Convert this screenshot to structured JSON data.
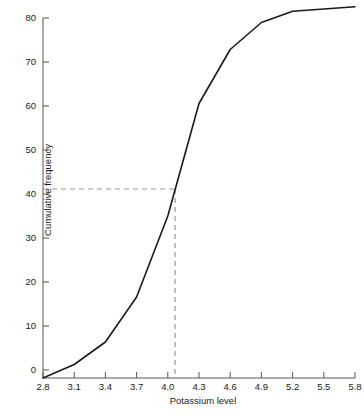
{
  "chart_data": {
    "type": "line",
    "title": "",
    "xlabel": "Potassium level",
    "ylabel": "Cumulative frequency",
    "xlim": [
      2.8,
      5.8
    ],
    "ylim": [
      0,
      82.5
    ],
    "grid": false,
    "legend": "none",
    "x": [
      2.8,
      3.1,
      3.4,
      3.7,
      4.0,
      4.3,
      4.6,
      4.9,
      5.2,
      5.5,
      5.8
    ],
    "values": [
      0,
      3,
      8,
      18,
      36,
      61,
      73,
      79,
      81.5,
      82,
      82.5
    ],
    "series": [
      {
        "name": "Cumulative frequency",
        "values": [
          0,
          3,
          8,
          18,
          36,
          61,
          73,
          79,
          81.5,
          82,
          82.5
        ]
      }
    ],
    "xticks": [
      "2.8",
      "3.1",
      "3.4",
      "3.7",
      "4.0",
      "4.3",
      "4.6",
      "4.9",
      "5.2",
      "5.5",
      "5.8"
    ],
    "xtick_values": [
      2.8,
      3.1,
      3.4,
      3.7,
      4.0,
      4.3,
      4.6,
      4.9,
      5.2,
      5.5,
      5.8
    ],
    "yticks": [
      "0",
      "10",
      "20",
      "30",
      "40",
      "50",
      "60",
      "70",
      "80"
    ],
    "ytick_values": [
      0,
      10,
      20,
      30,
      40,
      50,
      60,
      70,
      80
    ],
    "annotations": [
      {
        "name": "median-reference-lines",
        "style": "dashed",
        "y_value": 42,
        "x_value": 4.07,
        "description": "Dashed horizontal line at cumulative frequency 42 meeting the curve and dropping to the potassium level axis at about 4.07"
      }
    ],
    "colors": {
      "curve": "#1a1a1a",
      "axis": "#555555",
      "dashed_reference": "#999999",
      "background": "#ffffff",
      "text": "#1a1a1a"
    }
  }
}
